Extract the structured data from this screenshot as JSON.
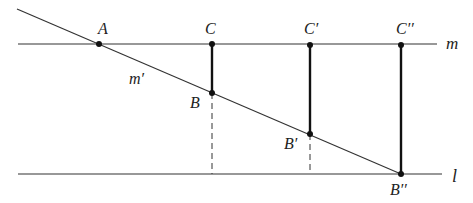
{
  "diagram": {
    "lines": [
      {
        "id": "m",
        "label": "m",
        "x1": 18,
        "y1": 44,
        "x2": 437,
        "y2": 44
      },
      {
        "id": "l",
        "label": "l",
        "x1": 18,
        "y1": 174,
        "x2": 442,
        "y2": 174
      },
      {
        "id": "m-prime",
        "label": "m′",
        "x1": 17,
        "y1": 9,
        "x2": 401,
        "y2": 174
      }
    ],
    "points": [
      {
        "id": "A",
        "label": "A",
        "x": 99,
        "y": 44
      },
      {
        "id": "C",
        "label": "C",
        "x": 212,
        "y": 44
      },
      {
        "id": "C1",
        "label": "C′",
        "x": 310,
        "y": 45
      },
      {
        "id": "C2",
        "label": "C′′",
        "x": 401,
        "y": 45
      },
      {
        "id": "B",
        "label": "B",
        "x": 212,
        "y": 93
      },
      {
        "id": "B1",
        "label": "B′",
        "x": 310,
        "y": 134
      },
      {
        "id": "B2",
        "label": "B′′",
        "x": 401,
        "y": 174
      }
    ],
    "segments": [
      {
        "from": "C",
        "to": "B",
        "style": "bold"
      },
      {
        "from": "C1",
        "to": "B1",
        "style": "bold"
      },
      {
        "from": "C2",
        "to": "B2",
        "style": "bold"
      }
    ],
    "dashed": [
      {
        "x": 212,
        "y1": 93,
        "y2": 174
      },
      {
        "x": 310,
        "y1": 134,
        "y2": 174
      }
    ],
    "labels": {
      "A": "A",
      "C": "C",
      "C1": "C′",
      "C2": "C′′",
      "m": "m",
      "m_prime": "m′",
      "B": "B",
      "B1": "B′",
      "B2": "B′′",
      "l": "l"
    }
  }
}
